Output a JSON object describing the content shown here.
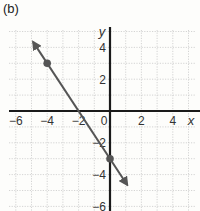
{
  "panel_label": "(b)",
  "chart_data": {
    "type": "line",
    "title": "(b)",
    "xlabel": "x",
    "ylabel": "y",
    "xlim": [
      -6.5,
      5.5
    ],
    "ylim": [
      -6.3,
      5
    ],
    "grid": true,
    "x_ticks": [
      -6,
      -4,
      -2,
      0,
      2,
      4
    ],
    "y_ticks": [
      4,
      2,
      -2,
      -4,
      -6
    ],
    "x_tick_labels": [
      "−6",
      "−4",
      "−2",
      "0",
      "2",
      "4"
    ],
    "y_tick_labels": [
      "4",
      "2",
      "−2",
      "−4",
      "−6"
    ],
    "series": [
      {
        "name": "line",
        "equation": "y = -3/2 x - 3",
        "slope": -1.5,
        "intercept": -3,
        "x_range": [
          -4.9,
          1.1
        ],
        "arrows": "both",
        "color": "#555555"
      }
    ],
    "points": [
      {
        "x": -4,
        "y": 3
      },
      {
        "x": 0,
        "y": -3
      }
    ]
  }
}
